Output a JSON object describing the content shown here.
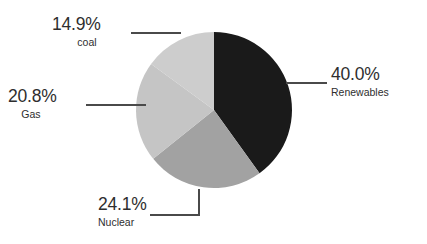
{
  "chart_data": {
    "type": "pie",
    "title": "",
    "subtitle": "",
    "xlabel": "",
    "ylabel": "",
    "legend_position": "none",
    "grid": false,
    "label_format": "percent_one_decimal",
    "start_angle_deg": 0,
    "direction": "clockwise",
    "categories": [
      "Renewables",
      "Nuclear",
      "Gas",
      "coal"
    ],
    "values": [
      40.0,
      24.1,
      20.8,
      14.9
    ],
    "units": "%",
    "total": 99.8,
    "slices": [
      {
        "id": "renewables",
        "label": "Renewables",
        "value": 40.0,
        "value_text": "40.0%",
        "color": "#1a1a1a",
        "start_angle_deg": 0,
        "end_angle_deg": 144.0,
        "leader_type": "horizontal",
        "label_side": "right"
      },
      {
        "id": "nuclear",
        "label": "Nuclear",
        "value": 24.1,
        "value_text": "24.1%",
        "color": "#a2a2a2",
        "start_angle_deg": 144.0,
        "end_angle_deg": 230.76,
        "leader_type": "elbow",
        "label_side": "bottom"
      },
      {
        "id": "gas",
        "label": "Gas",
        "value": 20.8,
        "value_text": "20.8%",
        "color": "#c5c5c5",
        "start_angle_deg": 230.76,
        "end_angle_deg": 305.64,
        "leader_type": "horizontal",
        "label_side": "left"
      },
      {
        "id": "coal",
        "label": "coal",
        "value": 14.9,
        "value_text": "14.9%",
        "color": "#cdcdcd",
        "start_angle_deg": 305.64,
        "end_angle_deg": 359.28,
        "leader_type": "horizontal",
        "label_side": "upper-left"
      }
    ],
    "colors": {
      "renewables": "#1a1a1a",
      "nuclear": "#a2a2a2",
      "gas": "#c5c5c5",
      "coal": "#cdcdcd",
      "leader_line": "#4a4a4a",
      "background": "#ffffff",
      "text": "#2e2e2e"
    }
  },
  "callouts": {
    "renewables": {
      "pct": "40.0%",
      "name": "Renewables"
    },
    "nuclear": {
      "pct": "24.1%",
      "name": "Nuclear"
    },
    "gas": {
      "pct": "20.8%",
      "name": "Gas"
    },
    "coal": {
      "pct": "14.9%",
      "name": "coal"
    }
  }
}
